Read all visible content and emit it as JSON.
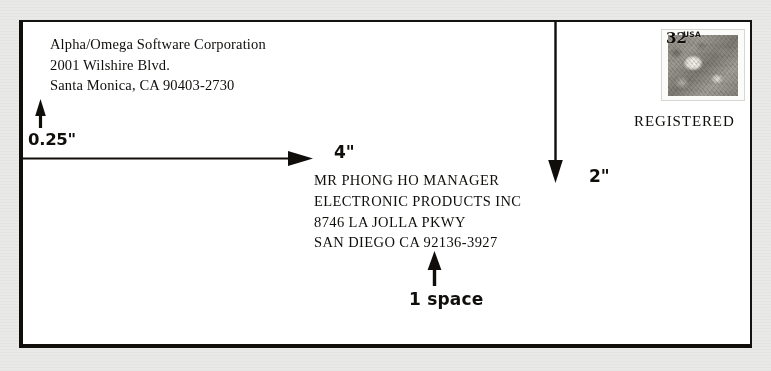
{
  "document": {
    "title": "Business envelope addressing diagram",
    "background_color": "#e9e9e7",
    "envelope_color": "#ffffff",
    "ink_color": "#100e0b"
  },
  "return_address": {
    "line1": "Alpha/Omega Software Corporation",
    "line2": "2001 Wilshire Blvd.",
    "line3": "Santa Monica, CA 90403-2730"
  },
  "destination_address": {
    "line1": "MR PHONG HO MANAGER",
    "line2": "ELECTRONIC PRODUCTS INC",
    "line3": "8746 LA JOLLA PKWY",
    "line4": "SAN DIEGO CA 92136-3927"
  },
  "callouts": {
    "left_margin": "0.25\"",
    "left_indent": "4\"",
    "top_margin": "2\"",
    "line_spacing": "1 space"
  },
  "stamp": {
    "denomination": "32",
    "country": "USA",
    "icon": "postage-stamp-icon"
  },
  "endorsement": {
    "label": "REGISTERED"
  },
  "arrows": {
    "left_margin_arrow": "up-arrow-icon",
    "indent_arrow": "right-arrow-icon",
    "top_margin_arrow": "down-arrow-icon",
    "line_spacing_arrow": "up-arrow-icon"
  }
}
